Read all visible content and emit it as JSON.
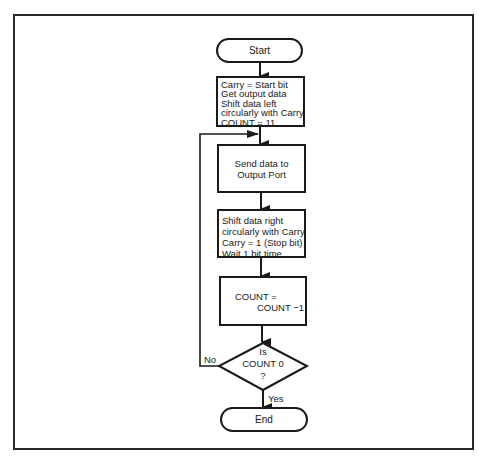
{
  "flowchart": {
    "title": "",
    "start": {
      "label": "Start"
    },
    "init": {
      "lines": [
        "Carry = Start bit",
        "Get output data",
        "Shift data left",
        "circularly with Carry",
        "COUNT = 11"
      ]
    },
    "send": {
      "lines": [
        "Send data to",
        "Output Port"
      ]
    },
    "shift": {
      "lines": [
        "Shift data right",
        "circularly with Carry",
        "Carry = 1 (Stop bit)",
        "Wait 1 bit time"
      ]
    },
    "decrement": {
      "lines": [
        "COUNT =",
        "COUNT −1"
      ]
    },
    "decision": {
      "lines": [
        "Is",
        "COUNT 0",
        "?"
      ],
      "yes_label": "Yes",
      "no_label": "No"
    },
    "end": {
      "label": "End"
    }
  },
  "colors": {
    "stroke": "#1a1a1a",
    "background": "#ffffff"
  }
}
